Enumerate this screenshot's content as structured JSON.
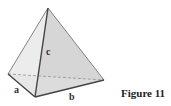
{
  "diagram": {
    "type": "tetrahedron",
    "caption": "Figure 11",
    "edge_labels": {
      "a": "a",
      "b": "b",
      "c": "c"
    },
    "vertices": {
      "apex": [
        48,
        8
      ],
      "left": [
        8,
        74
      ],
      "front": [
        35,
        97
      ],
      "right": [
        104,
        80
      ]
    },
    "colors": {
      "face_left": "#ececec",
      "face_right": "#d6d6d6",
      "face_bottom": "#e2e2e2",
      "edge": "#555555",
      "hidden_edge": "#888888"
    }
  }
}
